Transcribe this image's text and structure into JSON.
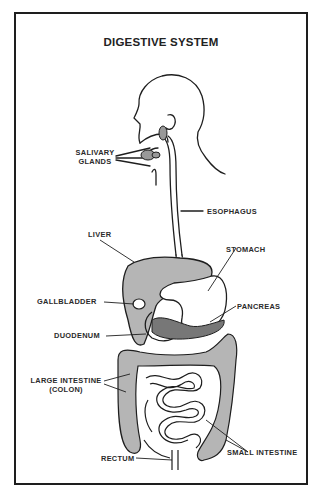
{
  "diagram": {
    "title": "DIGESTIVE SYSTEM",
    "labels": {
      "salivary_glands_1": "SALIVARY",
      "salivary_glands_2": "GLANDS",
      "esophagus": "ESOPHAGUS",
      "liver": "LIVER",
      "stomach": "STOMACH",
      "gallbladder": "GALLBLADDER",
      "pancreas": "PANCREAS",
      "duodenum": "DUODENUM",
      "large_intestine_1": "LARGE INTESTINE",
      "large_intestine_2": "(COLON)",
      "small_intestine": "SMALL INTESTINE",
      "rectum": "RECTUM"
    },
    "colors": {
      "line": "#1e1e1e",
      "organ_fill": "#b5b5b5",
      "background": "#ffffff"
    }
  }
}
